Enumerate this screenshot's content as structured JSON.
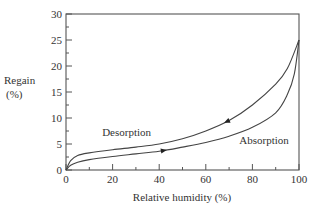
{
  "chart_data": {
    "type": "line",
    "title": "",
    "xlabel": "Relative humidity (%)",
    "ylabel": "Regain (%)",
    "ylabel_lines": [
      "Regain",
      "(%)"
    ],
    "xlim": [
      0,
      100
    ],
    "ylim": [
      0,
      30
    ],
    "x_ticks": [
      0,
      20,
      40,
      60,
      80,
      100
    ],
    "x_minor_ticks": [
      10,
      30,
      50,
      70,
      90
    ],
    "y_ticks": [
      0,
      5,
      10,
      15,
      20,
      25,
      30
    ],
    "y_minor_ticks": [
      2.5,
      7.5,
      12.5,
      17.5,
      22.5,
      27.5
    ],
    "grid": false,
    "legend": null,
    "series": [
      {
        "name": "Desorption",
        "x": [
          0,
          2,
          5,
          10,
          20,
          30,
          40,
          50,
          60,
          70,
          80,
          90,
          95,
          100
        ],
        "y": [
          0,
          1.8,
          2.8,
          3.3,
          3.9,
          4.4,
          5.0,
          6.0,
          7.5,
          9.5,
          12.5,
          16.5,
          19.5,
          25
        ],
        "arrow_at_x": 69,
        "arrow_direction": "decreasing-humidity"
      },
      {
        "name": "Absorption",
        "x": [
          0,
          2,
          5,
          10,
          20,
          30,
          40,
          50,
          60,
          70,
          80,
          90,
          95,
          98,
          100
        ],
        "y": [
          0,
          0.9,
          1.5,
          2.0,
          2.6,
          3.1,
          3.6,
          4.4,
          5.3,
          6.5,
          8.2,
          11.0,
          14.5,
          18.5,
          25
        ],
        "arrow_at_x": 42,
        "arrow_direction": "increasing-humidity"
      }
    ],
    "annotations": [
      {
        "text": "Desorption",
        "x": 26,
        "y": 7.3
      },
      {
        "text": "Absorption",
        "x": 85,
        "y": 5.8
      }
    ]
  }
}
